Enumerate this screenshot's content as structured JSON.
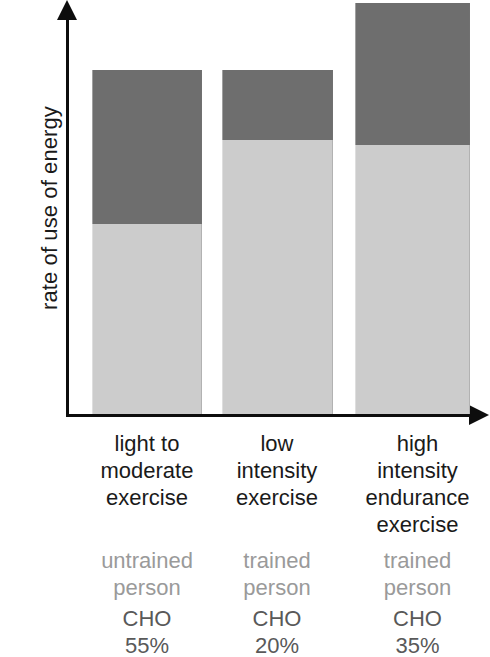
{
  "chart_data": {
    "type": "bar",
    "subtype": "stacked",
    "title": "",
    "xlabel": "",
    "ylabel": "rate of use of energy",
    "grid": false,
    "legend": "none",
    "axis_style": "arrow-headed, unlabelled (qualitative scale)",
    "categories": [
      "light to moderate exercise",
      "low intensity exercise",
      "high intensity endurance exercise"
    ],
    "series": [
      {
        "name": "CHO",
        "color": "#cccccc",
        "values": [
          55,
          20,
          35
        ]
      },
      {
        "name": "Fat",
        "color": "#6e6e6e",
        "values": [
          45,
          80,
          65
        ]
      }
    ],
    "bar_totals_relative": [
      100,
      100,
      119
    ]
  },
  "y_axis": {
    "title": "rate of use of energy",
    "arrow_icon": "arrow-up-icon"
  },
  "x_axis": {
    "arrow_icon": "arrow-right-icon"
  },
  "bars": [
    {
      "id": "bar-1",
      "x": 92,
      "width": 110,
      "top": 70,
      "split": 224,
      "bottom": 414,
      "cho_color": "#cccccc",
      "fat_color": "#6e6e6e"
    },
    {
      "id": "bar-2",
      "x": 222,
      "width": 111,
      "top": 70,
      "split": 140,
      "bottom": 414,
      "cho_color": "#cccccc",
      "fat_color": "#6e6e6e"
    },
    {
      "id": "bar-3",
      "x": 355,
      "width": 115,
      "top": 3,
      "split": 145,
      "bottom": 414,
      "cho_color": "#cccccc",
      "fat_color": "#6e6e6e"
    }
  ],
  "columns": [
    {
      "category_lines": [
        "light to",
        "moderate",
        "exercise"
      ],
      "person_lines": [
        "untrained",
        "person"
      ],
      "cho_lines": [
        "CHO",
        "55%"
      ],
      "cho_value": "55%"
    },
    {
      "category_lines": [
        "low",
        "intensity",
        "exercise"
      ],
      "person_lines": [
        "trained",
        "person"
      ],
      "cho_lines": [
        "CHO",
        "20%"
      ],
      "cho_value": "20%"
    },
    {
      "category_lines": [
        "high",
        "intensity",
        "endurance",
        "exercise"
      ],
      "person_lines": [
        "trained",
        "person"
      ],
      "cho_lines": [
        "CHO",
        "35%"
      ],
      "cho_value": "35%"
    }
  ],
  "colors": {
    "fat_segment": "#6e6e6e",
    "cho_segment": "#cccccc",
    "axis": "#0d0d0d",
    "category_text": "#1a1a1a",
    "person_text": "#9a9a9a",
    "cho_text": "#595959",
    "background": "#ffffff"
  }
}
